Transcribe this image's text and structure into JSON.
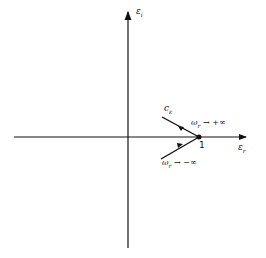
{
  "diagram": {
    "axes": {
      "horizontal_label": "εr",
      "vertical_label": "εi",
      "horizontal_label_main": "ε",
      "horizontal_label_sub": "r",
      "vertical_label_main": "ε",
      "vertical_label_sub": "i"
    },
    "point_label": "1",
    "curve_label_main": "c",
    "curve_label_sub": "ε",
    "upper_branch": {
      "label_main": "ω",
      "label_sub": "r",
      "label_rest": " → +∞",
      "description": "ωr → +∞"
    },
    "lower_branch": {
      "label_main": "ω",
      "label_sub": "r",
      "label_rest": " → −∞",
      "description": "ωr → −∞"
    },
    "colors": {
      "stroke": "#111111",
      "background": "#ffffff"
    }
  }
}
